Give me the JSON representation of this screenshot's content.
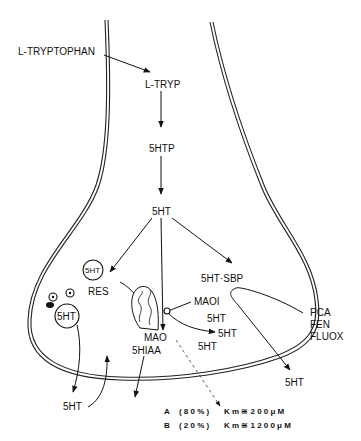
{
  "diagram": {
    "labels": {
      "l_tryptophan": "L-TRYPTOPHAN",
      "l_tryp": "L-TRYP",
      "five_htp": "5HTP",
      "five_ht_center": "5HT",
      "five_ht_sbp": "5HT·SBP",
      "maoi": "MAOI",
      "five_ht_a": "5HT",
      "five_ht_b": "5HT",
      "five_ht_c": "5HT",
      "pca": "PCA",
      "fen": "FEN",
      "fluox": "FLUOX",
      "five_ht_released_right": "5HT",
      "mao": "MAO",
      "five_hiaa": "5HIAA",
      "res": "RES",
      "vesicle_small": "5HT",
      "vesicle_large": "5HT",
      "five_ht_released_left": "5HT"
    },
    "legend": [
      {
        "key": "A",
        "percent": "(80%)",
        "km": "Km≅200μM"
      },
      {
        "key": "B",
        "percent": "(20%)",
        "km": "Km≅1200μM"
      }
    ]
  }
}
